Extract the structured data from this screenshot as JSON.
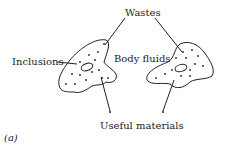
{
  "diagram": {
    "labels": {
      "wastes": "Wastes",
      "inclusions": "Inclusions",
      "body_fluids": "Body fluids",
      "useful_materials": "Useful materials",
      "panel": "(a)"
    },
    "colors": {
      "stroke": "#222222",
      "background": "#ffffff"
    }
  }
}
